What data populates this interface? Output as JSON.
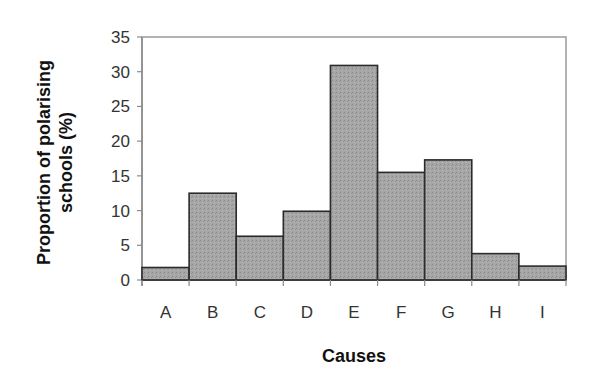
{
  "chart_data": {
    "type": "bar",
    "title": "",
    "xlabel": "Causes",
    "ylabel_lines": [
      "Proportion of polarising",
      "schools (%)"
    ],
    "ylabel": "Proportion of polarising schools (%)",
    "categories": [
      "A",
      "B",
      "C",
      "D",
      "E",
      "F",
      "G",
      "H",
      "I"
    ],
    "values": [
      1.8,
      12.5,
      6.3,
      9.9,
      30.9,
      15.5,
      17.3,
      3.8,
      2.0
    ],
    "ylim": [
      0,
      35
    ],
    "yticks": [
      0,
      5,
      10,
      15,
      20,
      25,
      30,
      35
    ],
    "grid": false,
    "legend": null,
    "bar_gap": 0,
    "colors": {
      "bar_fill": "#a9a9a9",
      "bar_edge": "#2b2b2b",
      "axis": "#8a8a8a",
      "frame": "#9a9a9a"
    }
  }
}
